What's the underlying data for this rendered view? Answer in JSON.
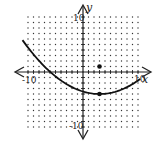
{
  "chart_data": {
    "type": "line",
    "title": "",
    "xlabel": "x",
    "ylabel": "y",
    "xlim": [
      -10,
      10
    ],
    "ylim": [
      -10,
      10
    ],
    "grid": true,
    "grid_style": "dotted",
    "tick_labels": {
      "x": [
        "-10",
        "10"
      ],
      "y": [
        "10",
        "-10"
      ]
    },
    "series": [
      {
        "name": "parabola",
        "equation": "y = (x - 3)^2 / 20 - 4",
        "vertex": [
          3,
          -4
        ],
        "x_range": [
          -11,
          10.4
        ]
      }
    ],
    "points": [
      {
        "name": "focus",
        "x": 3,
        "y": 1
      },
      {
        "name": "vertex",
        "x": 3,
        "y": -4
      }
    ]
  },
  "labels": {
    "x_axis": "x",
    "y_axis": "y",
    "x_min": "-10",
    "x_max": "10",
    "y_max": "10",
    "y_min": "-10"
  },
  "colors": {
    "curve": "#111111",
    "grid": "#333333",
    "background": "#ffffff"
  }
}
